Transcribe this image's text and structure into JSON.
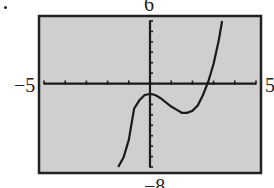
{
  "chart_data": {
    "type": "line",
    "title": "",
    "xlabel": "",
    "ylabel": "",
    "xlim": [
      -5,
      5
    ],
    "ylim": [
      -8,
      6
    ],
    "window_labels": {
      "xmin": "−5",
      "xmax": "5",
      "ymax": "6",
      "ymin": "−8"
    },
    "x_tick_step": 1,
    "y_tick_step": 1,
    "grid": false,
    "background": "#cfcfcf",
    "series": [
      {
        "name": "f(x)",
        "description": "cubic: local max near (0,-1), local min near (1.7,-2.8), x-intercept near 2.7",
        "x": [
          -1.5,
          -1.25,
          -1.0,
          -0.75,
          -0.5,
          -0.25,
          0.0,
          0.25,
          0.5,
          0.75,
          1.0,
          1.25,
          1.5,
          1.75,
          2.0,
          2.25,
          2.5,
          2.75,
          3.0,
          3.25,
          3.4
        ],
        "y": [
          -8.8,
          -7.1,
          -5.4,
          -2.4,
          -1.6,
          -1.1,
          -1.0,
          -1.1,
          -1.4,
          -1.8,
          -2.2,
          -2.5,
          -2.8,
          -2.8,
          -2.6,
          -2.1,
          -1.1,
          0.2,
          1.9,
          4.2,
          6.0
        ]
      }
    ]
  }
}
